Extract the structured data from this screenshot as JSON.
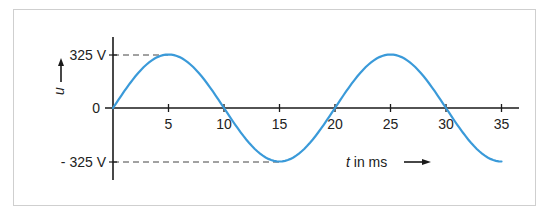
{
  "chart_data": {
    "type": "line",
    "title": "",
    "xlabel": "t in ms",
    "ylabel": "u",
    "x_ticks": [
      5,
      10,
      15,
      20,
      25,
      30,
      35
    ],
    "x_tick_labels": [
      "5",
      "10",
      "15",
      "20",
      "25",
      "30",
      "35"
    ],
    "y_tick_labels": [
      "325 V",
      "0",
      "- 325 V"
    ],
    "y_ticks": [
      325,
      0,
      -325
    ],
    "xlim": [
      0,
      36
    ],
    "ylim": [
      -325,
      325
    ],
    "grid": false,
    "legend": null,
    "series": [
      {
        "name": "u(t)",
        "function": "325 * sin(2*pi*t/20)",
        "amplitude": 325,
        "period_ms": 20,
        "frequency_hz": 50,
        "x": [
          0,
          2.5,
          5,
          7.5,
          10,
          12.5,
          15,
          17.5,
          20,
          22.5,
          25,
          27.5,
          30,
          32.5,
          35
        ],
        "values": [
          0,
          230,
          325,
          230,
          0,
          -230,
          -325,
          -230,
          0,
          230,
          325,
          230,
          0,
          -230,
          -325
        ],
        "color": "#3a9ad9"
      }
    ],
    "annotations": [
      {
        "type": "dashed-line",
        "from": [
          0,
          325
        ],
        "to": [
          5,
          325
        ]
      },
      {
        "type": "dashed-line",
        "from": [
          0,
          -325
        ],
        "to": [
          15,
          -325
        ]
      }
    ]
  },
  "labels": {
    "y_top": "325 V",
    "y_zero": "0",
    "y_bottom": "- 325 V",
    "y_axis": "u",
    "x_axis_var": "t",
    "x_axis_unit": " in ms",
    "x_ticks": [
      "5",
      "10",
      "15",
      "20",
      "25",
      "30",
      "35"
    ]
  },
  "colors": {
    "curve": "#3a9ad9",
    "axis": "#1a1a1a",
    "dash": "#444444",
    "frame": "#cfcfcf"
  }
}
